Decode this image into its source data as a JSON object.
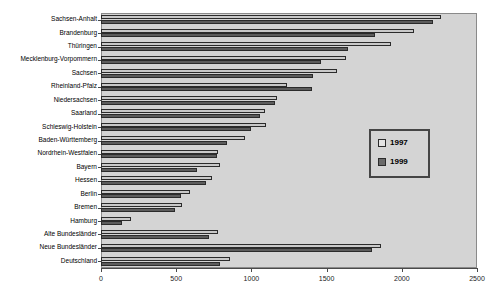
{
  "chart_data": {
    "type": "bar",
    "orientation": "horizontal",
    "title": "",
    "subtitle": "",
    "xlabel": "",
    "ylabel": "",
    "xlim": [
      0,
      2500
    ],
    "ylim": null,
    "grid": false,
    "legend_position": "right-middle",
    "tick_labels_x": [
      "0",
      "500",
      "1000",
      "1500",
      "2000",
      "2500"
    ],
    "tick_values_x": [
      0,
      500,
      1000,
      1500,
      2000,
      2500
    ],
    "categories": [
      "Sachsen-Anhalt",
      "Brandenburg",
      "Thüringen",
      "Mecklenburg-Vorpommern",
      "Sachsen",
      "Rheinland-Pfalz",
      "Niedersachsen",
      "Saarland",
      "Schleswig-Holstein",
      "Baden-Württemberg",
      "Nordrhein-Westfalen",
      "Bayern",
      "Hessen",
      "Berlin",
      "Bremen",
      "Hamburg",
      "Alte Bundesländer",
      "Neue Bundesländer",
      "Deutschland"
    ],
    "series": [
      {
        "name": "1997",
        "color": "#c9c9c9",
        "values": [
          2260,
          2080,
          1930,
          1630,
          1570,
          1240,
          1170,
          1090,
          1100,
          960,
          780,
          790,
          740,
          590,
          540,
          200,
          780,
          1860,
          860
        ]
      },
      {
        "name": "1999",
        "color": "#5c5c5c",
        "values": [
          2210,
          1820,
          1640,
          1460,
          1410,
          1400,
          1160,
          1060,
          1000,
          840,
          770,
          640,
          700,
          530,
          490,
          140,
          720,
          1800,
          790
        ]
      }
    ]
  },
  "legend": {
    "items": [
      {
        "label": "1997",
        "swatch": "legend-swatch-1997"
      },
      {
        "label": "1999",
        "swatch": "legend-swatch-1999"
      }
    ]
  },
  "colors": {
    "series_1997": "#c9c9c9",
    "series_1999": "#5c5c5c",
    "plot_background": "#d4d4d4",
    "frame_border": "#8a8a8a",
    "axis": "#4a4a4a",
    "legend_border": "#454545"
  }
}
